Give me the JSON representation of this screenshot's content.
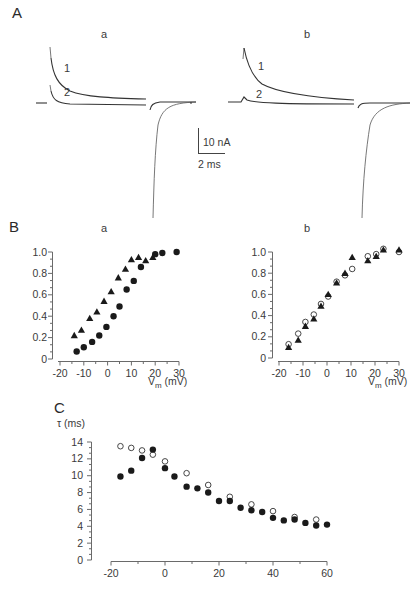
{
  "figure": {
    "panel_A": {
      "letter": "A",
      "sub_a": "a",
      "sub_b": "b",
      "trace_labels": [
        "1",
        "2"
      ],
      "scale_bar": {
        "vertical": "10 nA",
        "horizontal": "2 ms"
      }
    },
    "panel_B": {
      "letter": "B",
      "sub_a": "a",
      "sub_b": "b"
    },
    "panel_C": {
      "letter": "C"
    }
  },
  "chart_data": [
    {
      "id": "A-traces",
      "type": "line",
      "title": "Current traces (a, b)",
      "subplots": [
        "a",
        "b"
      ],
      "traces": [
        "1",
        "2"
      ],
      "scale_bar": {
        "current": "10 nA",
        "time": "2 ms"
      }
    },
    {
      "id": "Ba",
      "type": "scatter",
      "title": "a",
      "xlabel": "V_m (mV)",
      "ylabel": "",
      "xlim": [
        -20,
        30
      ],
      "ylim": [
        0,
        1.0
      ],
      "xticks": [
        -20,
        -10,
        0,
        10,
        20,
        30
      ],
      "yticks": [
        0,
        0.2,
        0.4,
        0.6,
        0.8,
        1.0
      ],
      "ytick_labels": [
        "0",
        "0.2",
        "0.4",
        "0.6",
        "0.8",
        "1.0"
      ],
      "series": [
        {
          "name": "triangles",
          "marker": "triangle-filled",
          "x": [
            -14,
            -11,
            -7.5,
            -4.5,
            -1.5,
            1.5,
            4.5,
            7.5,
            10,
            13,
            16,
            19
          ],
          "y": [
            0.22,
            0.27,
            0.38,
            0.44,
            0.54,
            0.63,
            0.76,
            0.84,
            0.93,
            0.95,
            0.92,
            0.95
          ]
        },
        {
          "name": "circles",
          "marker": "circle-filled",
          "x": [
            -13,
            -10,
            -6.5,
            -3.5,
            -0.5,
            2.5,
            5,
            8,
            11,
            14,
            20,
            23,
            29
          ],
          "y": [
            0.07,
            0.11,
            0.16,
            0.22,
            0.3,
            0.4,
            0.49,
            0.65,
            0.73,
            0.86,
            0.98,
            0.99,
            1.0
          ]
        }
      ]
    },
    {
      "id": "Bb",
      "type": "scatter",
      "title": "b",
      "xlabel": "V_m (mV)",
      "ylabel": "",
      "xlim": [
        -20,
        30
      ],
      "ylim": [
        0,
        1.0
      ],
      "xticks": [
        -20,
        -10,
        0,
        10,
        20,
        30
      ],
      "yticks": [
        0,
        0.2,
        0.4,
        0.6,
        0.8,
        1.0
      ],
      "ytick_labels": [
        "0",
        "0.2",
        "0.4",
        "0.6",
        "0.8",
        "1.0"
      ],
      "series": [
        {
          "name": "open-circles",
          "marker": "circle-open",
          "x": [
            -16,
            -12,
            -9,
            -5.5,
            -2.5,
            0.5,
            4,
            7.5,
            10.5,
            17,
            20.5,
            23.5,
            30
          ],
          "y": [
            0.13,
            0.23,
            0.34,
            0.41,
            0.51,
            0.58,
            0.72,
            0.78,
            0.84,
            0.96,
            0.98,
            1.03,
            1.0
          ]
        },
        {
          "name": "triangles",
          "marker": "triangle-filled",
          "x": [
            -16,
            -12,
            -9,
            -5.5,
            -2.5,
            0.5,
            4,
            7.5,
            10.5,
            17,
            20.5,
            23.5,
            30
          ],
          "y": [
            0.1,
            0.17,
            0.3,
            0.37,
            0.49,
            0.6,
            0.71,
            0.8,
            0.95,
            0.92,
            0.96,
            1.02,
            1.02
          ]
        }
      ]
    },
    {
      "id": "C",
      "type": "scatter",
      "title": "",
      "xlabel": "",
      "ylabel": "τ (ms)",
      "xlim": [
        -20,
        60
      ],
      "ylim": [
        0,
        14
      ],
      "xticks": [
        -20,
        0,
        20,
        40,
        60
      ],
      "yticks": [
        0,
        2,
        4,
        6,
        8,
        10,
        12,
        14
      ],
      "series": [
        {
          "name": "open-circles",
          "marker": "circle-open",
          "x": [
            -16.5,
            -12.5,
            -8.5,
            -4.5,
            0,
            8,
            16,
            24,
            32,
            40,
            48,
            56
          ],
          "y": [
            13.5,
            13.3,
            13.0,
            12.5,
            11.7,
            10.3,
            8.9,
            7.5,
            6.6,
            5.8,
            5.1,
            4.8
          ]
        },
        {
          "name": "filled-circles",
          "marker": "circle-filled",
          "x": [
            -16.5,
            -12.5,
            -8.5,
            -4.5,
            0,
            3.5,
            8,
            12,
            16,
            20,
            24,
            28,
            32,
            36,
            40,
            44,
            48,
            52,
            56,
            60
          ],
          "y": [
            9.9,
            10.6,
            12.1,
            13.1,
            10.9,
            9.9,
            8.7,
            8.5,
            8.0,
            7.0,
            7.0,
            6.2,
            5.9,
            5.7,
            5.0,
            4.7,
            4.8,
            4.4,
            4.1,
            4.2
          ]
        }
      ]
    }
  ]
}
